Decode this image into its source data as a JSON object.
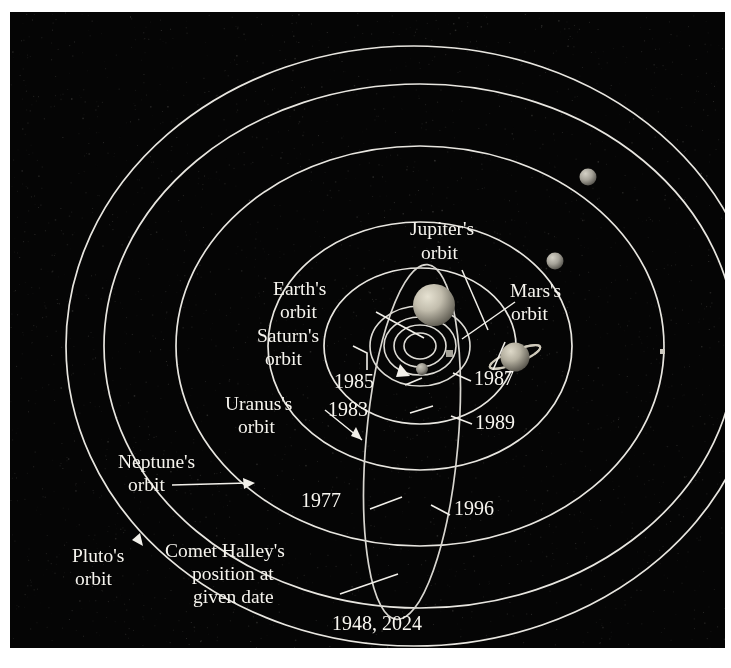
{
  "figure": {
    "background_color": "#050505",
    "line_color": "#e8e6e0",
    "text_color": "#f6f4ee",
    "frame_color": "#ffffff"
  },
  "labels": {
    "jupiter_orbit_l1": "Jupiter's",
    "jupiter_orbit_l2": "orbit",
    "earth_orbit_l1": "Earth's",
    "earth_orbit_l2": "orbit",
    "saturn_orbit_l1": "Saturn's",
    "saturn_orbit_l2": "orbit",
    "mars_orbit_l1": "Mars's",
    "mars_orbit_l2": "orbit",
    "uranus_orbit_l1": "Uranus's",
    "uranus_orbit_l2": "orbit",
    "neptune_orbit_l1": "Neptune's",
    "neptune_orbit_l2": "orbit",
    "pluto_orbit_l1": "Pluto's",
    "pluto_orbit_l2": "orbit",
    "comet_caption_l1": "Comet Halley's",
    "comet_caption_l2": "position at",
    "comet_caption_l3": "given date"
  },
  "year_markers": {
    "y1985": "1985",
    "y1983": "1983",
    "y1977": "1977",
    "y1987": "1987",
    "y1989": "1989",
    "y1996": "1996",
    "y1948_2024": "1948, 2024"
  },
  "bodies": [
    {
      "name": "jupiter",
      "label": "Jupiter",
      "cx": 424,
      "cy": 293,
      "r": 21,
      "color": "#b9b5a6",
      "rings": false
    },
    {
      "name": "saturn",
      "label": "Saturn",
      "cx": 505,
      "cy": 345,
      "r": 15,
      "color": "#b4b0a2",
      "rings": true
    },
    {
      "name": "uranus",
      "label": "Uranus",
      "cx": 545,
      "cy": 249,
      "r": 8,
      "color": "#a9a79c",
      "rings": false
    },
    {
      "name": "neptune",
      "label": "Neptune",
      "cx": 578,
      "cy": 165,
      "r": 8,
      "color": "#a9a79c",
      "rings": false
    },
    {
      "name": "pluto",
      "label": "Pluto",
      "cx": 652,
      "cy": 339,
      "r": 3,
      "color": "#bdbab0",
      "rings": false
    },
    {
      "name": "inner-planet",
      "label": "Inner planet",
      "cx": 412,
      "cy": 356,
      "r": 6,
      "color": "#9b988d",
      "rings": false
    },
    {
      "name": "comet-marker",
      "label": "Comet Halley",
      "cx": 439,
      "cy": 342,
      "r": 4,
      "color": "#9e9b90",
      "rings": false
    }
  ],
  "orbits": [
    {
      "name": "mercury-orbit",
      "rx": 16,
      "ry": 13
    },
    {
      "name": "venus-orbit",
      "rx": 26,
      "ry": 21
    },
    {
      "name": "earth-orbit",
      "rx": 36,
      "ry": 29
    },
    {
      "name": "mars-orbit",
      "rx": 50,
      "ry": 40
    },
    {
      "name": "jupiter-orbit",
      "rx": 96,
      "ry": 78
    },
    {
      "name": "saturn-orbit",
      "rx": 152,
      "ry": 124
    },
    {
      "name": "uranus-orbit",
      "rx": 244,
      "ry": 200
    },
    {
      "name": "neptune-orbit",
      "rx": 316,
      "ry": 262
    },
    {
      "name": "pluto-orbit",
      "rx": 382,
      "ry": 318
    }
  ]
}
